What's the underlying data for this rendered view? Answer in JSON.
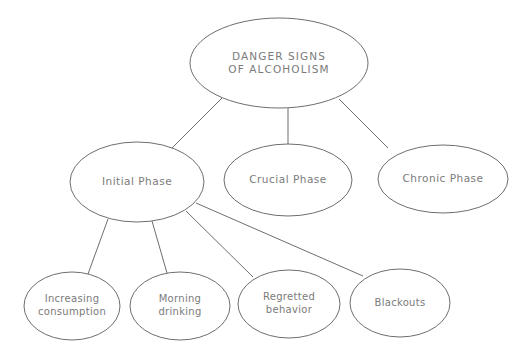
{
  "canvas": {
    "width": 532,
    "height": 359,
    "background": "#ffffff",
    "stroke_color": "#6e6e6e",
    "text_color": "#7b7b7b"
  },
  "diagram": {
    "type": "hierarchy-tree",
    "root": {
      "id": "root",
      "label": "DANGER SIGNS\nOF ALCOHOLISM",
      "cx": 279,
      "cy": 63,
      "rx": 89,
      "ry": 45
    },
    "phases": [
      {
        "id": "initial-phase",
        "label": "Initial Phase",
        "cx": 137,
        "cy": 182,
        "rx": 67,
        "ry": 40
      },
      {
        "id": "crucial-phase",
        "label": "Crucial Phase",
        "cx": 288,
        "cy": 180,
        "rx": 64,
        "ry": 36
      },
      {
        "id": "chronic-phase",
        "label": "Chronic Phase",
        "cx": 443,
        "cy": 179,
        "rx": 65,
        "ry": 34
      }
    ],
    "signs": [
      {
        "id": "increasing-consumption",
        "label": "Increasing\nconsumption",
        "cx": 72,
        "cy": 306,
        "rx": 48,
        "ry": 34
      },
      {
        "id": "morning-drinking",
        "label": "Morning\ndrinking",
        "cx": 180,
        "cy": 306,
        "rx": 50,
        "ry": 34
      },
      {
        "id": "regretted-behavior",
        "label": "Regretted\nbehavior",
        "cx": 289,
        "cy": 304,
        "rx": 51,
        "ry": 34
      },
      {
        "id": "blackouts",
        "label": "Blackouts",
        "cx": 400,
        "cy": 303,
        "rx": 50,
        "ry": 34
      }
    ],
    "edges": [
      {
        "id": "root-to-initial-phase",
        "from": "root",
        "to": "initial-phase",
        "x1": 222,
        "y1": 98,
        "x2": 172,
        "y2": 148
      },
      {
        "id": "root-to-crucial-phase",
        "from": "root",
        "to": "crucial-phase",
        "x1": 288,
        "y1": 108,
        "x2": 288,
        "y2": 144
      },
      {
        "id": "root-to-chronic-phase",
        "from": "root",
        "to": "chronic-phase",
        "x1": 339,
        "y1": 99,
        "x2": 388,
        "y2": 148
      },
      {
        "id": "initial-to-increasing-consumption",
        "from": "initial-phase",
        "to": "increasing-consumption",
        "x1": 108,
        "y1": 219,
        "x2": 88,
        "y2": 274
      },
      {
        "id": "initial-to-morning-drinking",
        "from": "initial-phase",
        "to": "morning-drinking",
        "x1": 152,
        "y1": 221,
        "x2": 167,
        "y2": 273
      },
      {
        "id": "initial-to-regretted-behavior",
        "from": "initial-phase",
        "to": "regretted-behavior",
        "x1": 186,
        "y1": 211,
        "x2": 253,
        "y2": 277
      },
      {
        "id": "initial-to-blackouts",
        "from": "initial-phase",
        "to": "blackouts",
        "x1": 196,
        "y1": 203,
        "x2": 363,
        "y2": 276
      }
    ]
  }
}
